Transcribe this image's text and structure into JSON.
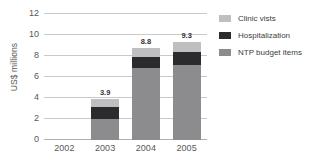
{
  "chart_data": {
    "type": "bar",
    "subtype": "stacked-bar",
    "title": "",
    "xlabel": "",
    "ylabel": "US$ millions",
    "categories": [
      "2002",
      "2003",
      "2004",
      "2005"
    ],
    "ylim": [
      0,
      12
    ],
    "yticks": [
      0,
      2,
      4,
      6,
      8,
      10,
      12
    ],
    "ytick_labels": [
      "0",
      "2",
      "4",
      "6",
      "8",
      "10",
      "12"
    ],
    "grid": "horizontal",
    "legend_position": "right",
    "series": [
      {
        "name": "NTP budget items",
        "color": "#8c8c8e",
        "values": [
          0,
          2.0,
          6.9,
          7.15
        ]
      },
      {
        "name": "Hospitalization",
        "color": "#2b2b2d",
        "values": [
          0,
          1.15,
          1.05,
          1.25
        ]
      },
      {
        "name": "Clinic vists",
        "color": "#bfbfc1",
        "values": [
          0,
          0.75,
          0.85,
          0.9
        ]
      }
    ],
    "stack_order_bottom_to_top": [
      "NTP budget items",
      "Hospitalization",
      "Clinic vists"
    ],
    "totals": [
      null,
      3.9,
      8.8,
      9.3
    ],
    "data_labels": [
      "",
      "3.9",
      "8.8",
      "9.3"
    ]
  },
  "legend": {
    "entries": [
      {
        "label": "Clinic vists",
        "color": "#bfbfc1"
      },
      {
        "label": "Hospitalization",
        "color": "#2b2b2d"
      },
      {
        "label": "NTP budget items",
        "color": "#8c8c8e"
      }
    ]
  },
  "colors": {
    "gridline": "#c9c9cb",
    "text": "#58585a",
    "label_text": "#333335",
    "background": "#ffffff"
  }
}
